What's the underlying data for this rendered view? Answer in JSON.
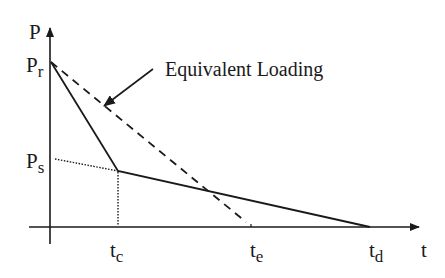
{
  "diagram": {
    "type": "load-time diagram",
    "axes": {
      "y_label": "P",
      "x_label": "t"
    },
    "y_ticks": [
      {
        "main": "P",
        "sub": "r"
      },
      {
        "main": "P",
        "sub": "s"
      }
    ],
    "x_ticks": [
      {
        "main": "t",
        "sub": "c"
      },
      {
        "main": "t",
        "sub": "e"
      },
      {
        "main": "t",
        "sub": "d"
      }
    ],
    "annotation": "Equivalent Loading",
    "series": [
      {
        "name": "actual-loading",
        "style": "solid",
        "points": [
          "(0, Pr)",
          "(tc, Ps)",
          "(td, 0)"
        ]
      },
      {
        "name": "equivalent-loading",
        "style": "dashed",
        "points": [
          "(0, Pr)",
          "(te, 0)"
        ]
      },
      {
        "name": "ps-extension",
        "style": "dotted",
        "points": [
          "(0, Ps)",
          "(tc, Ps)"
        ]
      },
      {
        "name": "tc-drop-line",
        "style": "dotted",
        "points": [
          "(tc, Ps)",
          "(tc, 0)"
        ]
      }
    ],
    "colors": {
      "ink": "#1a1a1a",
      "background": "#ffffff"
    }
  }
}
